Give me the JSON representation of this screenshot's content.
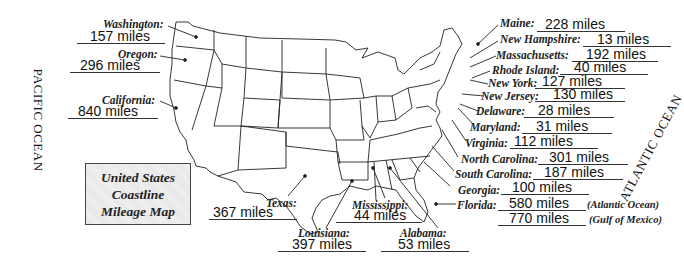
{
  "title": {
    "line1": "United States",
    "line2": "Coastline",
    "line3": "Mileage Map"
  },
  "oceans": {
    "pacific": "PACIFIC OCEAN",
    "atlantic": "ATLANTIC OCEAN"
  },
  "west": [
    {
      "state": "Washington:",
      "miles": "157 miles"
    },
    {
      "state": "Oregon:",
      "miles": "296 miles"
    },
    {
      "state": "California:",
      "miles": "840 miles"
    }
  ],
  "gulf": [
    {
      "state": "Texas:",
      "miles": "367 miles"
    },
    {
      "state": "Louisiana:",
      "miles": "397 miles"
    },
    {
      "state": "Mississippi:",
      "miles": "44 miles"
    },
    {
      "state": "Alabama:",
      "miles": "53 miles"
    }
  ],
  "east": [
    {
      "state": "Maine:",
      "miles": "228 miles"
    },
    {
      "state": "New Hampshire:",
      "miles": "13 miles"
    },
    {
      "state": "Massachusetts:",
      "miles": "192 miles"
    },
    {
      "state": "Rhode Island:",
      "miles": "40 miles"
    },
    {
      "state": "New York:",
      "miles": "127 miles"
    },
    {
      "state": "New Jersey:",
      "miles": "130 miles"
    },
    {
      "state": "Delaware:",
      "miles": "28 miles"
    },
    {
      "state": "Maryland:",
      "miles": "31 miles"
    },
    {
      "state": "Virginia:",
      "miles": "112 miles"
    },
    {
      "state": "North Carolina:",
      "miles": "301 miles"
    },
    {
      "state": "South Carolina:",
      "miles": "187 miles"
    },
    {
      "state": "Georgia:",
      "miles": "100 miles"
    }
  ],
  "florida": {
    "state": "Florida:",
    "atlantic_miles": "580 miles",
    "atlantic_note": "(Atlantic Ocean)",
    "gulf_miles": "770 miles",
    "gulf_note": "(Gulf of Mexico)"
  }
}
